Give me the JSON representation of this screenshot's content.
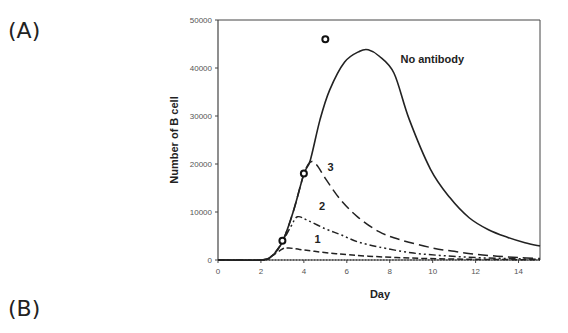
{
  "panels": {
    "a": "(A)",
    "b": "(B)"
  },
  "chart_data": {
    "type": "line",
    "title": "",
    "xlabel": "Day",
    "ylabel": "Number of B cell",
    "xlim": [
      0,
      15
    ],
    "ylim": [
      0,
      50000
    ],
    "xticks": [
      0,
      2,
      4,
      6,
      8,
      10,
      12,
      14
    ],
    "yticks": [
      0,
      10000,
      20000,
      30000,
      40000,
      50000
    ],
    "grid": false,
    "legend": "inline labels",
    "series": [
      {
        "name": "No antibody",
        "style": "solid",
        "x": [
          0,
          1,
          2,
          2.5,
          3,
          3.5,
          4,
          4.3,
          4.75,
          5.2,
          5.9,
          6.6,
          7,
          7.5,
          8.2,
          8.9,
          9.9,
          10.8,
          11.7,
          12.6,
          13.5,
          14.3,
          15
        ],
        "y": [
          0,
          0,
          0,
          800,
          3800,
          10000,
          17900,
          20800,
          29200,
          35400,
          41250,
          43500,
          43800,
          42500,
          38900,
          29400,
          18900,
          13000,
          8800,
          6300,
          4700,
          3600,
          2900
        ]
      },
      {
        "name": "3",
        "style": "long-dash",
        "x": [
          0,
          2,
          2.5,
          3,
          3.5,
          4,
          4.3,
          4.6,
          5,
          5.7,
          6.5,
          7.5,
          8.5,
          10,
          11,
          12,
          13,
          14,
          15
        ],
        "y": [
          0,
          0,
          800,
          3800,
          10000,
          17900,
          20400,
          19800,
          17000,
          12600,
          9000,
          5900,
          4200,
          2500,
          1800,
          1200,
          800,
          500,
          300
        ]
      },
      {
        "name": "2",
        "style": "dash-dot-dot",
        "x": [
          0,
          2,
          2.5,
          3,
          3.4,
          3.7,
          4.2,
          5,
          5.7,
          6.5,
          7.5,
          9,
          10.5,
          12,
          13.5,
          15
        ],
        "y": [
          0,
          0,
          800,
          3800,
          7000,
          9000,
          8200,
          6500,
          5300,
          3800,
          2700,
          1500,
          900,
          500,
          300,
          150
        ]
      },
      {
        "name": "1",
        "style": "short-dash",
        "x": [
          0,
          2,
          2.5,
          3,
          3.3,
          3.8,
          4.5,
          5.5,
          7,
          9,
          11,
          13,
          15
        ],
        "y": [
          0,
          0,
          800,
          2300,
          2500,
          2200,
          1800,
          1300,
          800,
          400,
          200,
          100,
          50
        ]
      },
      {
        "name": "baseline",
        "style": "dotted",
        "x": [
          0,
          15
        ],
        "y": [
          0,
          0
        ]
      }
    ],
    "markers": [
      {
        "x": 3,
        "y": 4000
      },
      {
        "x": 4,
        "y": 18000
      },
      {
        "x": 5,
        "y": 46000
      }
    ],
    "annotations": [
      {
        "text": "No antibody",
        "x": 8.5,
        "y": 41000
      },
      {
        "text": "3",
        "x": 5.1,
        "y": 18500
      },
      {
        "text": "2",
        "x": 4.7,
        "y": 10500
      },
      {
        "text": "1",
        "x": 4.5,
        "y": 3500
      }
    ]
  }
}
